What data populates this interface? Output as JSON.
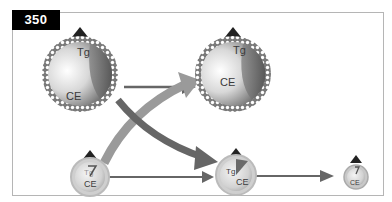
{
  "figure": {
    "number": "350",
    "colors": {
      "frame": "#b5b5b5",
      "label_bg": "#000000",
      "label_text": "#ffffff",
      "arrow_dark": "#666666",
      "arrow_light": "#9a9a9a",
      "apo_cap": "#222222"
    }
  },
  "particles": [
    {
      "id": "large-left",
      "labels": {
        "core_top": "Tg",
        "core_bottom": "CE"
      }
    },
    {
      "id": "large-right",
      "labels": {
        "core_top": "Tg",
        "core_bottom": "CE"
      }
    },
    {
      "id": "small-left",
      "labels": {
        "core_top": "Tg",
        "core_bottom": "CE"
      }
    },
    {
      "id": "medium-center",
      "labels": {
        "core_top": "Tg",
        "core_bottom": "CE"
      }
    },
    {
      "id": "tiny-right",
      "labels": {
        "core_top": "Tg",
        "core_bottom": "CE"
      }
    }
  ],
  "arrows": [
    {
      "from": "large-left",
      "to": "large-right",
      "style": "thin-dark"
    },
    {
      "from": "large-left",
      "to": "medium-center",
      "style": "thick-dark-curved"
    },
    {
      "from": "small-left",
      "to": "large-right",
      "style": "thick-light-curved"
    },
    {
      "from": "small-left",
      "to": "medium-center",
      "style": "thin-dark"
    },
    {
      "from": "medium-center",
      "to": "tiny-right",
      "style": "thin-dark"
    }
  ]
}
